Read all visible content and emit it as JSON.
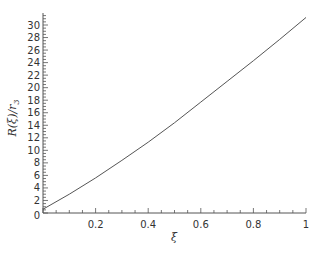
{
  "chart_data": {
    "type": "line",
    "title": "",
    "xlabel": "ξ",
    "ylabel": "R(ξ)/r₃",
    "xlim": [
      0,
      1
    ],
    "ylim": [
      0,
      31.5
    ],
    "grid": false,
    "legend": null,
    "x_ticks": [
      0.2,
      0.4,
      0.6,
      0.8,
      1
    ],
    "x_tick_labels": [
      "0.2",
      "0.4",
      "0.6",
      "0.8",
      "1"
    ],
    "y_ticks": [
      0,
      2,
      4,
      6,
      8,
      10,
      12,
      14,
      16,
      18,
      20,
      22,
      24,
      26,
      28,
      30
    ],
    "y_tick_labels": [
      "0",
      "2",
      "4",
      "6",
      "8",
      "10",
      "12",
      "14",
      "16",
      "18",
      "20",
      "22",
      "24",
      "26",
      "28",
      "30"
    ],
    "series": [
      {
        "name": "R(ξ)/r₃",
        "color": "#555555",
        "x": [
          0,
          0.1,
          0.2,
          0.3,
          0.4,
          0.5,
          0.6,
          0.7,
          0.8,
          0.9,
          1.0
        ],
        "values": [
          0.6,
          3.0,
          5.6,
          8.4,
          11.3,
          14.4,
          17.7,
          21.0,
          24.3,
          27.7,
          31.2
        ]
      }
    ]
  },
  "axes": {
    "x_label": "ξ",
    "y_label_main": "R(ξ)/r",
    "y_label_sub": "3"
  }
}
